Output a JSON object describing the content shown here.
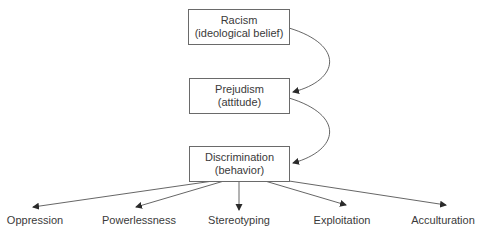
{
  "diagram": {
    "nodes": [
      {
        "id": "racism",
        "title": "Racism",
        "subtitle": "(ideological belief)"
      },
      {
        "id": "prejudism",
        "title": "Prejudism",
        "subtitle": "(attitude)"
      },
      {
        "id": "discrimination",
        "title": "Discrimination",
        "subtitle": "(behavior)"
      }
    ],
    "outcomes": [
      "Oppression",
      "Powerlessness",
      "Stereotyping",
      "Exploitation",
      "Acculturation"
    ],
    "edges": [
      {
        "from": "racism",
        "to": "prejudism"
      },
      {
        "from": "prejudism",
        "to": "discrimination"
      },
      {
        "from": "discrimination",
        "to": "Oppression"
      },
      {
        "from": "discrimination",
        "to": "Powerlessness"
      },
      {
        "from": "discrimination",
        "to": "Stereotyping"
      },
      {
        "from": "discrimination",
        "to": "Exploitation"
      },
      {
        "from": "discrimination",
        "to": "Acculturation"
      }
    ],
    "colors": {
      "line": "#4a4a4a",
      "text": "#3a3a3a",
      "box_border": "#6a6a6a"
    }
  }
}
